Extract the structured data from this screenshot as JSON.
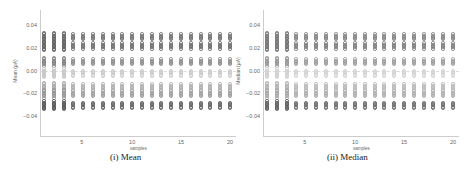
{
  "chart_data": [
    {
      "type": "scatter",
      "title": "",
      "caption": "(i) Mean",
      "xlabel": "samples",
      "ylabel": "Mean (μA)",
      "xlim": [
        1,
        20
      ],
      "ylim": [
        -0.05,
        0.05
      ],
      "xticks": [
        5,
        10,
        15,
        20
      ],
      "yticks": [
        0.04,
        0.02,
        0.0,
        -0.02,
        -0.04
      ],
      "ytick_labels": [
        "0.04",
        "0.02",
        "0.00",
        "−0.02",
        "−0.04"
      ],
      "grid": false,
      "x": [
        1,
        2,
        3,
        4,
        5,
        6,
        7,
        8,
        9,
        10,
        11,
        12,
        13,
        14,
        15,
        16,
        17,
        18,
        19,
        20
      ],
      "clusters_y": [
        0.03,
        0.022,
        0.008,
        -0.002,
        -0.014,
        -0.02,
        -0.03
      ],
      "cluster_intensity": [
        0.8,
        0.85,
        0.65,
        0.3,
        0.45,
        0.55,
        0.9
      ]
    },
    {
      "type": "scatter",
      "title": "",
      "caption": "(ii) Median",
      "xlabel": "samples",
      "ylabel": "Median (μA)",
      "xlim": [
        1,
        20
      ],
      "ylim": [
        -0.05,
        0.05
      ],
      "xticks": [
        5,
        10,
        15,
        20
      ],
      "yticks": [
        0.04,
        0.02,
        0.0,
        -0.02,
        -0.04
      ],
      "ytick_labels": [
        "0.04",
        "0.02",
        "0.00",
        "−0.02",
        "−0.04"
      ],
      "grid": false,
      "x": [
        1,
        2,
        3,
        4,
        5,
        6,
        7,
        8,
        9,
        10,
        11,
        12,
        13,
        14,
        15,
        16,
        17,
        18,
        19,
        20
      ],
      "clusters_y": [
        0.03,
        0.022,
        0.008,
        -0.002,
        -0.014,
        -0.02,
        -0.03
      ],
      "cluster_intensity": [
        0.7,
        0.75,
        0.55,
        0.25,
        0.4,
        0.45,
        0.85
      ]
    }
  ]
}
